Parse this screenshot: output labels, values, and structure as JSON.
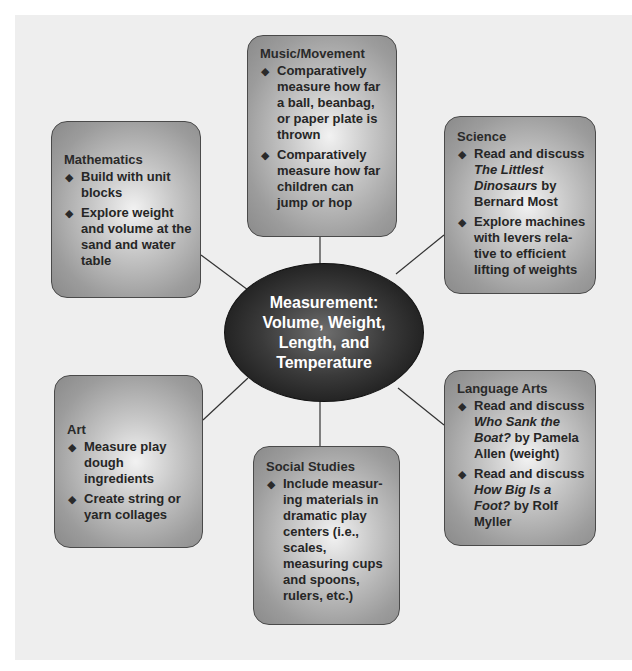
{
  "diagram": {
    "center": {
      "lines": [
        "Measurement:",
        "Volume, Weight,",
        "Length, and",
        "Temperature"
      ]
    },
    "nodes": {
      "music": {
        "title": "Music/Movement",
        "items": [
          {
            "text": "Comparatively measure how far a ball, beanbag, or paper plate is thrown"
          },
          {
            "text": "Comparatively measure how far children can jump or hop"
          }
        ]
      },
      "math": {
        "title": "Mathematics",
        "items": [
          {
            "text": "Build with unit blocks"
          },
          {
            "text": "Explore weight and volume at the sand and water table"
          }
        ]
      },
      "science": {
        "title": "Science",
        "items": [
          {
            "pre": "Read and discuss ",
            "italic": "The Littlest Dinosaurs",
            "post": " by Bernard Most"
          },
          {
            "text": "Explore machines with levers rela-tive to efficient lifting of weights"
          }
        ]
      },
      "art": {
        "title": "Art",
        "items": [
          {
            "text": "Measure play dough ingredients"
          },
          {
            "text": "Create string or yarn collages"
          }
        ]
      },
      "social": {
        "title": "Social Studies",
        "items": [
          {
            "text": "Include measur-ing materials in dramatic play centers (i.e., scales, measuring cups and spoons, rulers, etc.)"
          }
        ]
      },
      "language": {
        "title": "Language Arts",
        "items": [
          {
            "pre": "Read and discuss ",
            "italic": "Who Sank the Boat?",
            "post": " by Pamela Allen (weight)"
          },
          {
            "pre": "Read and discuss ",
            "italic": "How Big Is a Foot?",
            "post": " by Rolf Myller"
          }
        ]
      }
    },
    "bullet_glyph": "◆",
    "colors": {
      "panel": "#eeeeee",
      "hub": "#1c1c1c",
      "box_edge": "#8a8a8a",
      "box_center": "#f2f2f2",
      "line": "#333333"
    }
  }
}
